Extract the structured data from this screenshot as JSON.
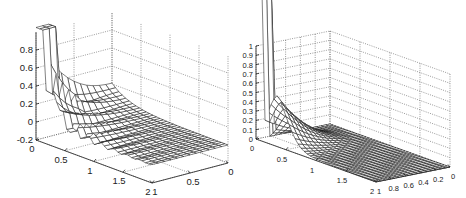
{
  "chart_data": [
    {
      "type": "surface",
      "title": "",
      "xlabel": "",
      "ylabel": "",
      "zlabel": "",
      "x_range": [
        0,
        2
      ],
      "y_range": [
        0,
        1
      ],
      "z_range": [
        -0.2,
        1.0
      ],
      "x_ticks": [
        "0",
        "0.5",
        "1",
        "1.5",
        "2"
      ],
      "y_ticks": [
        "0",
        "0.5",
        "1"
      ],
      "z_ticks": [
        "-0.2",
        "0",
        "0.2",
        "0.4",
        "0.6",
        "0.8"
      ],
      "grid": true,
      "description": "Oscillatory mesh surface: tall clipped spike near x=0 (value exceeds 1), secondary peak ~0.75 near x≈0.3, rapidly decaying oscillations with small negative dips along x, flat near 0 for large x."
    },
    {
      "type": "surface",
      "title": "",
      "xlabel": "",
      "ylabel": "",
      "zlabel": "",
      "x_range": [
        0,
        2
      ],
      "y_range": [
        0,
        1
      ],
      "z_range": [
        0,
        1
      ],
      "x_ticks": [
        "0",
        "0.5",
        "1",
        "1.5",
        "2"
      ],
      "y_ticks": [
        "0",
        "0.2",
        "0.4",
        "0.6",
        "0.8",
        "1"
      ],
      "z_ticks": [
        "0",
        "0.1",
        "0.2",
        "0.3",
        "0.4",
        "0.5",
        "0.6",
        "0.7",
        "0.8",
        "0.9",
        "1"
      ],
      "grid": true,
      "description": "Smooth non-negative mesh surface: clipped spike at x≈0, y≈1 (value exceeds 1), smooth hump peaking ~0.5 near x≈0.3 decaying to 0 for large x."
    }
  ],
  "left_plot": {
    "z_ticks": [
      {
        "label": "0.8",
        "y": 46
      },
      {
        "label": "0.6",
        "y": 64
      },
      {
        "label": "0.4",
        "y": 82
      },
      {
        "label": "0.2",
        "y": 100
      },
      {
        "label": "0",
        "y": 118
      },
      {
        "label": "-0.2",
        "y": 136
      }
    ],
    "x_ticks": [
      "0",
      "0.5",
      "1",
      "1.5",
      "2"
    ],
    "y_ticks": [
      "1",
      "0.5",
      "0"
    ]
  },
  "right_plot": {
    "z_ticks": [
      "0",
      "0.1",
      "0.2",
      "0.3",
      "0.4",
      "0.5",
      "0.6",
      "0.7",
      "0.8",
      "0.9",
      "1"
    ],
    "x_ticks": [
      "0",
      "0.5",
      "1",
      "1.5",
      "2"
    ],
    "y_ticks": [
      "1",
      "0.8",
      "0.6",
      "0.4",
      "0.2",
      "0"
    ]
  }
}
